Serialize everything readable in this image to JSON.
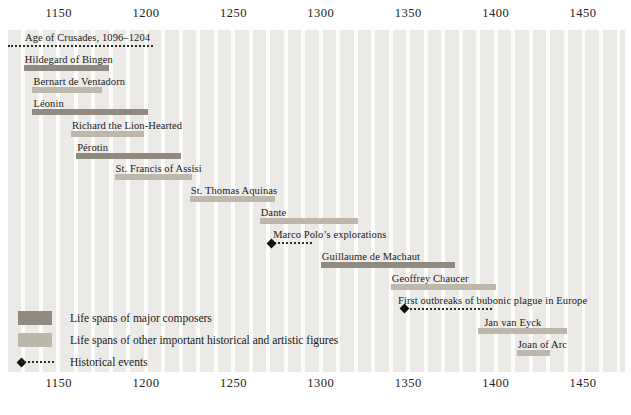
{
  "chart_data": {
    "type": "bar",
    "subtype": "horizontal-timeline",
    "title": "",
    "x_axis": {
      "min": 1121,
      "max": 1474,
      "ticks": [
        1150,
        1200,
        1250,
        1300,
        1350,
        1400,
        1450
      ],
      "stripe_period_years": 10,
      "grid": "alternating decade stripes"
    },
    "legend": [
      {
        "label": "Life spans of major composers",
        "type": "composer",
        "color": "#908a80"
      },
      {
        "label": "Life spans of other important historical and artistic figures",
        "type": "figure",
        "color": "#bdb8ab"
      },
      {
        "label": "Historical events",
        "type": "event",
        "color": "#1f1f1f"
      }
    ],
    "rows": [
      {
        "label": "Age of Crusades, 1096–1204",
        "type": "event",
        "start": 1096,
        "end": 1204,
        "diamond": false
      },
      {
        "label": "Hildegard of Bingen",
        "type": "composer",
        "start": 1130,
        "end": 1179
      },
      {
        "label": "Bernart de Ventadorn",
        "type": "figure",
        "start": 1135,
        "end": 1175
      },
      {
        "label": "Léonin",
        "type": "composer",
        "start": 1135,
        "end": 1201
      },
      {
        "label": "Richard the Lion-Hearted",
        "type": "figure",
        "start": 1157,
        "end": 1199
      },
      {
        "label": "Pérotin",
        "type": "composer",
        "start": 1160,
        "end": 1220
      },
      {
        "label": "St. Francis of Assisi",
        "type": "figure",
        "start": 1182,
        "end": 1226
      },
      {
        "label": "St. Thomas Aquinas",
        "type": "figure",
        "start": 1225,
        "end": 1274
      },
      {
        "label": "Dante",
        "type": "figure",
        "start": 1265,
        "end": 1321
      },
      {
        "label": "Marco Polo’s explorations",
        "type": "event",
        "start": 1271,
        "end": 1295,
        "diamond": true
      },
      {
        "label": "Guillaume de Machaut",
        "type": "composer",
        "start": 1300,
        "end": 1377
      },
      {
        "label": "Geoffrey Chaucer",
        "type": "figure",
        "start": 1340,
        "end": 1400
      },
      {
        "label": "First outbreaks of bubonic plague in Europe",
        "type": "event",
        "start": 1347,
        "end": 1398,
        "diamond": true
      },
      {
        "label": "Jan van Eyck",
        "type": "figure",
        "start": 1390,
        "end": 1441
      },
      {
        "label": "Joan of Arc",
        "type": "figure",
        "start": 1412,
        "end": 1431
      }
    ],
    "layout_hints": {
      "legend_position": "bottom-left inside plot",
      "row_spacing_px": 21.9,
      "label_indent_px": {
        "0": 17,
        "9": 3,
        "12": -5,
        "13": 6
      }
    }
  }
}
